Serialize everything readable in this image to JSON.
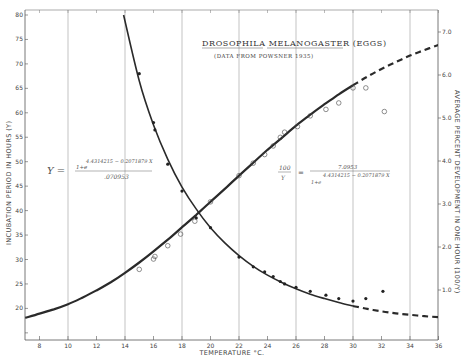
{
  "chart_data": {
    "type": "line",
    "title": "DROSOPHILA MELANOGASTER (EGGS)",
    "subtitle": "(DATA FROM POWSNER 1935)",
    "xlabel": "TEMPERATURE °C.",
    "ylabel_left": "INCUBATION PERIOD IN HOURS (Y)",
    "ylabel_right": "AVERAGE PERCENT DEVELOPMENT IN ONE HOUR (100/Y)",
    "xlim": [
      7,
      36
    ],
    "ylim_left": [
      14,
      80
    ],
    "ylim_right": [
      0,
      7.5
    ],
    "x_ticks": [
      "8",
      "10",
      "12",
      "14",
      "16",
      "18",
      "20",
      "22",
      "24",
      "26",
      "28",
      "30",
      "32",
      "34",
      "36"
    ],
    "y_left_ticks": [
      "80",
      "75",
      "70",
      "65",
      "60",
      "55",
      "50",
      "45",
      "40",
      "35",
      "30",
      "25",
      "20"
    ],
    "y_right_ticks": [
      "7.0",
      "6.0",
      "5.0",
      "4.0",
      "3.0",
      "2.0",
      "1.0"
    ],
    "grid": {
      "vertical_lines_at": [
        10,
        14,
        18,
        22,
        26,
        30,
        34
      ],
      "horizontal": false
    },
    "equations": {
      "left": {
        "lhs": "Y =",
        "numerator": "1+e",
        "exponent": "4.4314215 − 0.2071879 X",
        "denominator": ".070953"
      },
      "right": {
        "lhs_num": "100",
        "lhs_den": "Y",
        "equals": "=",
        "numerator": "7.0953",
        "denominator": "1+e",
        "exponent": "4.4314215 − 0.2071879 X"
      }
    },
    "series": [
      {
        "name": "Incubation period (hours), fitted curve",
        "axis": "left",
        "style": "solid",
        "x": [
          13.9,
          15,
          16,
          17,
          18,
          19,
          20,
          21,
          22,
          23,
          24,
          25,
          26,
          27,
          28,
          29,
          30
        ],
        "values": [
          80,
          66.5,
          57.5,
          50.5,
          44.8,
          40.3,
          36.5,
          33.4,
          30.8,
          28.6,
          26.8,
          25.3,
          24.0,
          22.9,
          22.0,
          21.2,
          20.5
        ]
      },
      {
        "name": "Incubation period (hours), extrapolated",
        "axis": "left",
        "style": "dashed",
        "x": [
          30,
          31,
          32,
          33,
          34,
          35,
          36
        ],
        "values": [
          20.5,
          19.9,
          19.4,
          19.0,
          18.7,
          18.4,
          18.2
        ]
      },
      {
        "name": "Incubation period observed (filled dots)",
        "axis": "left",
        "style": "points-filled",
        "x": [
          15,
          16,
          16.1,
          17,
          18,
          19,
          20,
          22,
          23,
          23.8,
          24.4,
          24.9,
          25.2,
          26,
          27,
          28.1,
          29,
          30,
          30.9,
          32.1
        ],
        "values": [
          68,
          58,
          56.5,
          49.5,
          44,
          38.5,
          36.5,
          30.5,
          28.5,
          27.5,
          26.5,
          25.5,
          25.0,
          24.3,
          23.5,
          22.7,
          22.0,
          21.5,
          22.0,
          23.5
        ]
      },
      {
        "name": "Development rate (%/hour), fitted curve",
        "axis": "right",
        "style": "solid",
        "x": [
          7,
          8,
          9,
          10,
          11,
          12,
          13,
          14,
          15,
          16,
          17,
          18,
          19,
          20,
          21,
          22,
          23,
          24,
          25,
          26,
          27,
          28,
          29,
          30
        ],
        "values": [
          0.35,
          0.45,
          0.55,
          0.67,
          0.82,
          0.99,
          1.18,
          1.4,
          1.64,
          1.9,
          2.17,
          2.46,
          2.75,
          3.05,
          3.35,
          3.66,
          3.96,
          4.26,
          4.54,
          4.82,
          5.08,
          5.32,
          5.55,
          5.76
        ]
      },
      {
        "name": "Development rate (%/hour), extrapolated",
        "axis": "right",
        "style": "dashed",
        "x": [
          30,
          31,
          32,
          33,
          34,
          35,
          36
        ],
        "values": [
          5.76,
          5.96,
          6.14,
          6.3,
          6.45,
          6.58,
          6.7
        ]
      },
      {
        "name": "Development rate observed (open circles)",
        "axis": "right",
        "style": "points-open",
        "x": [
          15,
          16,
          16.1,
          17,
          17.9,
          18.9,
          20,
          22,
          23,
          23.8,
          24.4,
          24.9,
          25.2,
          26.1,
          27,
          28.1,
          29,
          30,
          30.9,
          32.2
        ],
        "values": [
          1.48,
          1.72,
          1.78,
          2.03,
          2.3,
          2.6,
          3.05,
          3.66,
          3.95,
          4.15,
          4.35,
          4.55,
          4.67,
          4.8,
          5.05,
          5.2,
          5.35,
          5.7,
          5.7,
          5.15
        ]
      }
    ]
  }
}
